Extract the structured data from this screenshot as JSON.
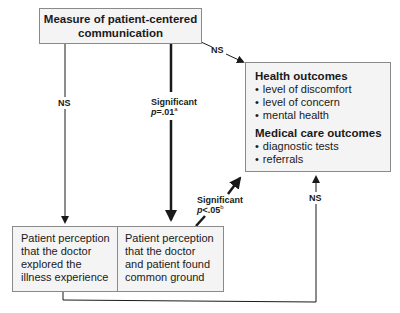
{
  "diagram": {
    "nodes": {
      "measure": {
        "line1": "Measure of patient-centered",
        "line2": "communication"
      },
      "outcomes": {
        "health_header": "Health outcomes",
        "health_items": [
          "level of discomfort",
          "level of concern",
          "mental health"
        ],
        "medical_header": "Medical care outcomes",
        "medical_items": [
          "diagnostic tests",
          "referrals"
        ]
      },
      "perception_explored": {
        "lines": [
          "Patient perception",
          "that the doctor",
          "explored the",
          "illness experience"
        ]
      },
      "perception_common_ground": {
        "lines": [
          "Patient perception",
          "that the doctor",
          "and patient found",
          "common ground"
        ]
      }
    },
    "edges": {
      "measure_to_outcomes": {
        "label": "NS"
      },
      "measure_to_explored": {
        "label": "NS"
      },
      "measure_to_common_ground": {
        "label": "Significant",
        "p_prefix": "p",
        "p_value": "=.01",
        "footnote": "a"
      },
      "common_ground_to_outcomes": {
        "label": "Significant",
        "p_prefix": "p",
        "p_value": "<.05",
        "footnote": "b"
      },
      "explored_to_outcomes": {
        "label": "NS"
      }
    },
    "colors": {
      "box_fill": "#f4f4f4",
      "box_border": "#8a8a8a",
      "line": "#1a1a1a"
    }
  }
}
